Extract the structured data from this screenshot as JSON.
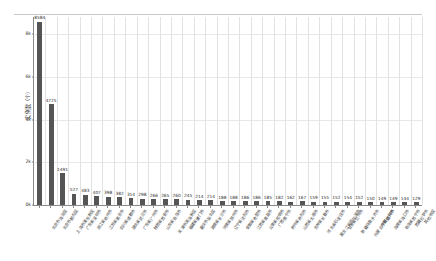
{
  "chart_data": {
    "type": "bar",
    "title": "",
    "subtitle": "",
    "xlabel": "",
    "ylabel": "实例数（个）",
    "ylim": [
      0,
      8800
    ],
    "grid": "both",
    "legend": "none",
    "bar_color": "#555555",
    "orientation": "vertical",
    "sorted": "descending",
    "yticks": [
      "0k",
      "1k",
      "2k",
      "3k",
      "4k",
      "6k",
      "8k"
    ],
    "ytick_values": [
      0,
      2000,
      4000,
      6000,
      8000
    ],
    "ytick_labels": [
      "0k",
      "2k",
      "4k",
      "6k",
      "8k"
    ],
    "categories": [
      "北京市海淀区",
      "北京市朝阳区",
      "上海市浦东新区",
      "广东省深圳市",
      "浙江省杭州市",
      "江苏省南京市",
      "四川省成都市",
      "湖北省武汉市",
      "广东省广州市",
      "陕西省西安市",
      "山东省青岛市",
      "天津市滨海新区",
      "福建省厦门市",
      "重庆市渝北区",
      "湖南省长沙市",
      "河南省郑州市",
      "辽宁省沈阳市",
      "安徽省合肥市",
      "江西省南昌市",
      "云南省昆明市",
      "广西南宁市",
      "贵州省贵阳市",
      "山西省太原市",
      "吉林省长春市",
      "河北省石家庄市",
      "黑龙江省哈尔滨市",
      "甘肃省兰州市",
      "新疆乌鲁木齐市",
      "内蒙古呼和浩特市",
      "宁夏银川市",
      "海南省海口市",
      "青海省西宁市",
      "西藏拉萨市",
      "其他地区"
    ],
    "values": [
      8584,
      4725,
      1491,
      527,
      483,
      407,
      398,
      382,
      314,
      298,
      266,
      265,
      260,
      245,
      214,
      214,
      188,
      188,
      186,
      186,
      185,
      182,
      162,
      167,
      159,
      155,
      152,
      154,
      152,
      150,
      149,
      149,
      144,
      129
    ]
  }
}
